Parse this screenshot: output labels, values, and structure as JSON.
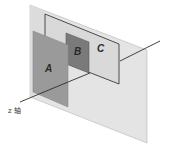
{
  "diagram": {
    "axis": {
      "label": "z 轴"
    },
    "planes": [
      {
        "id": "background",
        "label": "",
        "fill": "#e4e4e4",
        "stroke": "#b5b5b5"
      },
      {
        "id": "C",
        "label": "C",
        "fill": "#d9d9d9",
        "stroke": "#3a3a3a"
      },
      {
        "id": "B",
        "label": "B",
        "fill": "#7a7a7a",
        "stroke": "#5a5a5a"
      },
      {
        "id": "A",
        "label": "A",
        "fill": "#9a9a9a",
        "stroke": "#8a8a8a"
      }
    ],
    "colors": {
      "axis_line": "#2e2e2e",
      "label_text": "#2a2a2a"
    }
  }
}
